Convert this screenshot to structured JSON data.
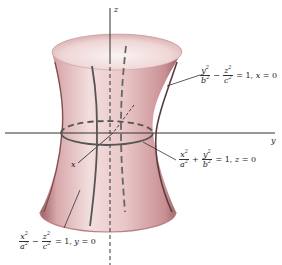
{
  "figure": {
    "axes": {
      "x": "x",
      "y": "y",
      "z": "z"
    },
    "colors": {
      "surface": "#e8c3c3",
      "surface_dark": "#a86f72",
      "axis": "#333333",
      "trace": "#555555"
    },
    "labels": {
      "trace_x0": {
        "num1": "y",
        "den1": "b",
        "op": "−",
        "num2": "z",
        "den2": "c",
        "rhs": "= 1, ",
        "cond_var": "x",
        "cond_rest": " = 0"
      },
      "trace_z0": {
        "num1": "x",
        "den1": "a",
        "op": "+",
        "num2": "y",
        "den2": "b",
        "rhs": "= 1, ",
        "cond_var": "z",
        "cond_rest": " = 0"
      },
      "trace_y0": {
        "num1": "x",
        "den1": "a",
        "op": "−",
        "num2": "z",
        "den2": "c",
        "rhs": "= 1, ",
        "cond_var": "y",
        "cond_rest": " = 0"
      },
      "exp": "2"
    }
  }
}
